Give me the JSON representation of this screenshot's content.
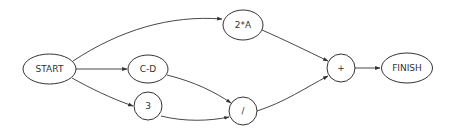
{
  "diagram": {
    "type": "flow-graph",
    "nodes": [
      {
        "id": "start",
        "label": "START",
        "shape": "ellipse",
        "cx": 49.5,
        "cy": 69,
        "rx": 26.5,
        "ry": 15
      },
      {
        "id": "cd",
        "label": "C-D",
        "shape": "ellipse",
        "cx": 148,
        "cy": 69,
        "rx": 20,
        "ry": 14
      },
      {
        "id": "three",
        "label": "3",
        "shape": "ellipse",
        "cx": 148,
        "cy": 106,
        "rx": 14,
        "ry": 14
      },
      {
        "id": "twoA",
        "label": "2*A",
        "shape": "ellipse",
        "cx": 243,
        "cy": 25,
        "rx": 20,
        "ry": 15
      },
      {
        "id": "div",
        "label": "/",
        "shape": "ellipse",
        "cx": 243,
        "cy": 111,
        "rx": 14,
        "ry": 14
      },
      {
        "id": "plus",
        "label": "+",
        "shape": "ellipse",
        "cx": 341,
        "cy": 68,
        "rx": 14,
        "ry": 14
      },
      {
        "id": "finish",
        "label": "FINISH",
        "shape": "ellipse",
        "cx": 407,
        "cy": 68,
        "rx": 25.5,
        "ry": 15
      }
    ],
    "edges": [
      {
        "from": "start",
        "to": "twoA",
        "path": "M 73 61 C 120 30, 170 15, 222 19"
      },
      {
        "from": "start",
        "to": "cd",
        "path": "M 76 69 L 127 69"
      },
      {
        "from": "start",
        "to": "three",
        "path": "M 72 78 C 90 88, 110 98, 133 106"
      },
      {
        "from": "twoA",
        "to": "plus",
        "path": "M 262 30 C 285 40, 305 50, 328 61"
      },
      {
        "from": "cd",
        "to": "div",
        "path": "M 167 75 C 195 82, 215 92, 231 103"
      },
      {
        "from": "three",
        "to": "div",
        "path": "M 161 116 C 185 122, 210 121, 229 117"
      },
      {
        "from": "div",
        "to": "plus",
        "path": "M 257 111 C 285 102, 305 88, 328 76"
      },
      {
        "from": "plus",
        "to": "finish",
        "path": "M 355 68 L 380 68"
      }
    ]
  }
}
